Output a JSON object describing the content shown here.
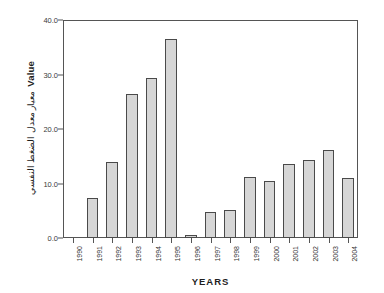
{
  "chart_data": {
    "type": "bar",
    "title": "",
    "xlabel": "YEARS",
    "ylabel": "Value",
    "ylabel_secondary": "معيار معدل الضغط النفسي",
    "categories": [
      "1990",
      "1991",
      "1992",
      "1993",
      "1994",
      "1995",
      "1996",
      "1997",
      "1998",
      "1999",
      "2000",
      "2001",
      "2002",
      "2003",
      "2004"
    ],
    "values": [
      0.0,
      7.3,
      14.0,
      26.4,
      29.4,
      36.6,
      0.5,
      4.7,
      5.2,
      11.2,
      10.4,
      13.6,
      14.4,
      16.1,
      11.1
    ],
    "ylim": [
      0.0,
      40.0
    ],
    "yticks": [
      "0.0",
      "10.0",
      "20.0",
      "30.0",
      "40.0"
    ],
    "ytick_values": [
      0,
      10,
      20,
      30,
      40
    ],
    "grid": false,
    "legend": "none",
    "bar_fill_color": "#d6d6d6",
    "bar_edge_color": "#4a4a4a",
    "axis_color": "#555555",
    "background_color": "#ffffff"
  }
}
